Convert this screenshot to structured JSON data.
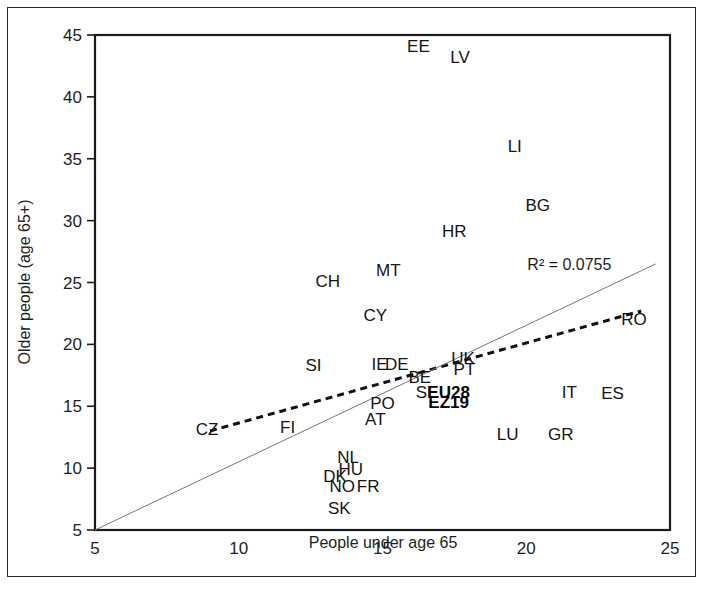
{
  "figure": {
    "frame_color": "#2a2a2a",
    "background": "#ffffff"
  },
  "chart_data": {
    "type": "scatter",
    "title": "",
    "subtitle": "",
    "xlabel": "People under age 65",
    "ylabel": "Older people (age 65+)",
    "xlim": [
      5,
      25
    ],
    "ylim": [
      5,
      45
    ],
    "xticks": [
      "5",
      "10",
      "15",
      "20",
      "25"
    ],
    "yticks": [
      "5",
      "10",
      "15",
      "20",
      "25",
      "30",
      "35",
      "40",
      "45"
    ],
    "grid": false,
    "legend_position": "none",
    "annotations": [
      {
        "name": "r-squared",
        "text": "R² = 0.0755",
        "x": 21.5,
        "y": 26.0
      }
    ],
    "lines": [
      {
        "name": "trendline",
        "style": "dashed",
        "color": "#111111",
        "x0": 9.0,
        "y0": 13.0,
        "x1": 24.0,
        "y1": 22.7
      },
      {
        "name": "diagonal-reference",
        "style": "solid",
        "color": "#777777",
        "x0": 5.0,
        "y0": 5.0,
        "x1": 24.5,
        "y1": 26.5
      }
    ],
    "point_label_offset": {
      "dx": 0,
      "dy": 0
    },
    "points": [
      {
        "label": "EE",
        "x": 16.25,
        "y": 43.65,
        "bold": false
      },
      {
        "label": "LV",
        "x": 17.7,
        "y": 42.75,
        "bold": false
      },
      {
        "label": "LI",
        "x": 19.6,
        "y": 35.55,
        "bold": false
      },
      {
        "label": "BG",
        "x": 20.4,
        "y": 30.75,
        "bold": false
      },
      {
        "label": "HR",
        "x": 17.5,
        "y": 28.7,
        "bold": false
      },
      {
        "label": "MT",
        "x": 15.2,
        "y": 25.55,
        "bold": false
      },
      {
        "label": "CH",
        "x": 13.1,
        "y": 24.6,
        "bold": false
      },
      {
        "label": "CY",
        "x": 14.75,
        "y": 21.85,
        "bold": false
      },
      {
        "label": "RO",
        "x": 23.75,
        "y": 21.55,
        "bold": false
      },
      {
        "label": "SI",
        "x": 12.6,
        "y": 17.85,
        "bold": false
      },
      {
        "label": "IE",
        "x": 14.9,
        "y": 17.95,
        "bold": false
      },
      {
        "label": "DE",
        "x": 15.5,
        "y": 17.95,
        "bold": false
      },
      {
        "label": "UK",
        "x": 17.8,
        "y": 18.45,
        "bold": false
      },
      {
        "label": "PT",
        "x": 17.85,
        "y": 17.55,
        "bold": false
      },
      {
        "label": "BE",
        "x": 16.3,
        "y": 16.85,
        "bold": false
      },
      {
        "label": "SE",
        "x": 16.55,
        "y": 15.7,
        "bold": false
      },
      {
        "label": "EU28",
        "x": 17.3,
        "y": 15.7,
        "bold": true
      },
      {
        "label": "EZ19",
        "x": 17.3,
        "y": 14.85,
        "bold": true
      },
      {
        "label": "IT",
        "x": 21.5,
        "y": 15.65,
        "bold": false
      },
      {
        "label": "ES",
        "x": 23.0,
        "y": 15.55,
        "bold": false
      },
      {
        "label": "PO",
        "x": 15.0,
        "y": 14.8,
        "bold": false
      },
      {
        "label": "AT",
        "x": 14.75,
        "y": 13.45,
        "bold": false
      },
      {
        "label": "CZ",
        "x": 8.9,
        "y": 12.65,
        "bold": false
      },
      {
        "label": "FI",
        "x": 11.7,
        "y": 12.8,
        "bold": false
      },
      {
        "label": "LU",
        "x": 19.35,
        "y": 12.3,
        "bold": false
      },
      {
        "label": "GR",
        "x": 21.2,
        "y": 12.3,
        "bold": false
      },
      {
        "label": "NL",
        "x": 13.8,
        "y": 10.45,
        "bold": false
      },
      {
        "label": "HU",
        "x": 13.9,
        "y": 9.45,
        "bold": false
      },
      {
        "label": "DK",
        "x": 13.35,
        "y": 8.9,
        "bold": false
      },
      {
        "label": "NO",
        "x": 13.6,
        "y": 8.1,
        "bold": false
      },
      {
        "label": "FR",
        "x": 14.5,
        "y": 8.1,
        "bold": false
      },
      {
        "label": "SK",
        "x": 13.5,
        "y": 6.3,
        "bold": false
      }
    ]
  }
}
